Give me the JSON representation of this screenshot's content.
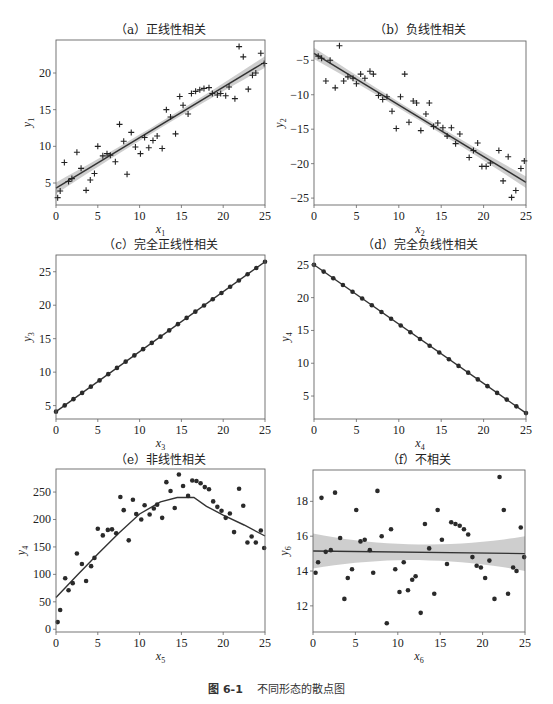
{
  "figure": {
    "caption_number": "图 6-1",
    "caption_text": "不同形态的散点图"
  },
  "chart_data": [
    {
      "id": "a",
      "type": "scatter",
      "title": "（a）正线性相关",
      "xlabel": "x",
      "xlabel_sub": "1",
      "ylabel": "y",
      "ylabel_sub": "1",
      "xlim": [
        0,
        25
      ],
      "ylim": [
        2,
        24.5
      ],
      "xticks": [
        0,
        5,
        10,
        15,
        20,
        25
      ],
      "yticks": [
        5,
        10,
        15,
        20
      ],
      "grid": false,
      "marker": "plus",
      "fit": {
        "type": "linear",
        "x": [
          0,
          25
        ],
        "y": [
          4.3,
          21.5
        ],
        "ci": true
      },
      "points": [
        [
          0.2,
          3.0
        ],
        [
          0.5,
          3.9
        ],
        [
          1.0,
          7.8
        ],
        [
          1.5,
          5.2
        ],
        [
          1.9,
          5.6
        ],
        [
          2.5,
          9.2
        ],
        [
          3.0,
          7.0
        ],
        [
          3.6,
          4.0
        ],
        [
          4.1,
          5.4
        ],
        [
          4.6,
          6.3
        ],
        [
          5.0,
          10.0
        ],
        [
          5.6,
          8.7
        ],
        [
          6.1,
          9.0
        ],
        [
          6.5,
          8.8
        ],
        [
          7.1,
          7.9
        ],
        [
          7.6,
          13.0
        ],
        [
          8.1,
          10.7
        ],
        [
          8.5,
          6.2
        ],
        [
          9.0,
          11.9
        ],
        [
          9.5,
          9.9
        ],
        [
          10.1,
          9.0
        ],
        [
          10.6,
          11.2
        ],
        [
          11.1,
          9.8
        ],
        [
          11.6,
          10.8
        ],
        [
          12.1,
          11.4
        ],
        [
          12.7,
          9.7
        ],
        [
          13.2,
          15.0
        ],
        [
          13.7,
          14.0
        ],
        [
          14.3,
          11.7
        ],
        [
          14.8,
          16.8
        ],
        [
          15.2,
          15.6
        ],
        [
          15.8,
          14.4
        ],
        [
          16.2,
          17.2
        ],
        [
          16.7,
          17.5
        ],
        [
          17.2,
          17.7
        ],
        [
          17.7,
          17.9
        ],
        [
          18.3,
          18.0
        ],
        [
          18.7,
          17.2
        ],
        [
          19.3,
          17.0
        ],
        [
          19.7,
          17.2
        ],
        [
          20.3,
          16.9
        ],
        [
          20.7,
          18.1
        ],
        [
          21.4,
          16.5
        ],
        [
          21.9,
          23.6
        ],
        [
          22.4,
          22.2
        ],
        [
          23.0,
          17.8
        ],
        [
          23.5,
          19.7
        ],
        [
          23.9,
          20.0
        ],
        [
          24.5,
          22.7
        ],
        [
          24.9,
          21.3
        ]
      ]
    },
    {
      "id": "b",
      "type": "scatter",
      "title": "（b）负线性相关",
      "xlabel": "x",
      "xlabel_sub": "2",
      "ylabel": "y",
      "ylabel_sub": "2",
      "xlim": [
        0,
        25
      ],
      "ylim": [
        -26,
        -2.2
      ],
      "xticks": [
        0,
        5,
        10,
        15,
        20,
        25
      ],
      "yticks": [
        -5,
        -10,
        -15,
        -20,
        -25
      ],
      "grid": false,
      "marker": "plus",
      "fit": {
        "type": "linear",
        "x": [
          0,
          25
        ],
        "y": [
          -4.0,
          -22.7
        ],
        "ci": true
      },
      "points": [
        [
          0.5,
          -4.4
        ],
        [
          0.9,
          -4.7
        ],
        [
          1.4,
          -8.0
        ],
        [
          1.9,
          -5.0
        ],
        [
          2.5,
          -9.0
        ],
        [
          3.0,
          -2.9
        ],
        [
          3.5,
          -8.0
        ],
        [
          4.0,
          -7.4
        ],
        [
          4.6,
          -7.6
        ],
        [
          5.0,
          -8.4
        ],
        [
          5.5,
          -7.0
        ],
        [
          6.0,
          -7.6
        ],
        [
          6.6,
          -6.6
        ],
        [
          7.0,
          -7.0
        ],
        [
          7.6,
          -10.1
        ],
        [
          8.1,
          -10.7
        ],
        [
          8.6,
          -10.3
        ],
        [
          9.2,
          -12.4
        ],
        [
          9.7,
          -14.9
        ],
        [
          10.2,
          -10.3
        ],
        [
          10.7,
          -7.0
        ],
        [
          11.2,
          -14.0
        ],
        [
          11.7,
          -10.9
        ],
        [
          12.1,
          -11.2
        ],
        [
          12.6,
          -15.2
        ],
        [
          13.2,
          -12.8
        ],
        [
          13.6,
          -11.2
        ],
        [
          14.1,
          -14.6
        ],
        [
          14.6,
          -14.1
        ],
        [
          15.2,
          -14.8
        ],
        [
          15.7,
          -16.0
        ],
        [
          16.2,
          -14.8
        ],
        [
          16.7,
          -17.1
        ],
        [
          17.2,
          -15.7
        ],
        [
          18.3,
          -19.1
        ],
        [
          18.8,
          -18.1
        ],
        [
          19.3,
          -17.0
        ],
        [
          19.8,
          -20.4
        ],
        [
          20.3,
          -20.4
        ],
        [
          20.8,
          -19.9
        ],
        [
          21.8,
          -18.1
        ],
        [
          22.3,
          -22.5
        ],
        [
          22.9,
          -19.0
        ],
        [
          23.3,
          -24.9
        ],
        [
          23.8,
          -23.9
        ],
        [
          24.4,
          -20.7
        ],
        [
          24.8,
          -19.6
        ]
      ]
    },
    {
      "id": "c",
      "type": "line",
      "title": "（c）完全正线性相关",
      "xlabel": "x",
      "xlabel_sub": "3",
      "ylabel": "y",
      "ylabel_sub": "3",
      "xlim": [
        0,
        25
      ],
      "ylim": [
        3,
        27.5
      ],
      "xticks": [
        0,
        5,
        10,
        15,
        20,
        25
      ],
      "yticks": [
        5,
        10,
        15,
        20,
        25
      ],
      "grid": false,
      "marker": "dot",
      "fit": {
        "type": "linear",
        "x": [
          0,
          25
        ],
        "y": [
          4.1,
          26.5
        ],
        "ci": false
      },
      "line": {
        "x0": 0,
        "y0": 4.1,
        "x1": 25,
        "y1": 26.5,
        "n": 25
      }
    },
    {
      "id": "d",
      "type": "line",
      "title": "（d）完全负线性相关",
      "xlabel": "x",
      "xlabel_sub": "4",
      "ylabel": "y",
      "ylabel_sub": "4",
      "xlim": [
        0,
        25
      ],
      "ylim": [
        1.5,
        26.5
      ],
      "xticks": [
        0,
        5,
        10,
        15,
        20,
        25
      ],
      "yticks": [
        5,
        10,
        15,
        20,
        25
      ],
      "grid": false,
      "marker": "dot",
      "fit": {
        "type": "linear",
        "x": [
          0,
          25
        ],
        "y": [
          25.0,
          2.4
        ],
        "ci": false
      },
      "line": {
        "x0": 0,
        "y0": 25.0,
        "x1": 25,
        "y1": 2.4,
        "n": 23
      }
    },
    {
      "id": "e",
      "type": "scatter",
      "title": "（e）非线性相关",
      "xlabel": "x",
      "xlabel_sub": "5",
      "ylabel": "y",
      "ylabel_sub": "4",
      "xlim": [
        0,
        25
      ],
      "ylim": [
        -5,
        292
      ],
      "xticks": [
        0,
        5,
        10,
        15,
        20,
        25
      ],
      "yticks": [
        0,
        50,
        100,
        150,
        200,
        250
      ],
      "grid": false,
      "marker": "dot",
      "fit": {
        "type": "lowess",
        "x": [
          0,
          2.5,
          5,
          7.5,
          10,
          12.5,
          14.5,
          16.5,
          18,
          20,
          22.5,
          25
        ],
        "y": [
          58,
          98,
          137,
          175,
          210,
          232,
          240,
          240,
          224,
          208,
          190,
          170
        ],
        "ci": false
      },
      "points": [
        [
          0.2,
          13
        ],
        [
          0.5,
          35
        ],
        [
          1.1,
          93
        ],
        [
          1.5,
          71
        ],
        [
          2.0,
          84
        ],
        [
          2.5,
          138
        ],
        [
          3.1,
          119
        ],
        [
          3.6,
          88
        ],
        [
          4.2,
          115
        ],
        [
          4.6,
          130
        ],
        [
          5.0,
          183
        ],
        [
          5.6,
          171
        ],
        [
          6.2,
          181
        ],
        [
          6.7,
          182
        ],
        [
          7.2,
          175
        ],
        [
          7.7,
          241
        ],
        [
          8.1,
          217
        ],
        [
          8.7,
          162
        ],
        [
          9.2,
          236
        ],
        [
          9.6,
          210
        ],
        [
          10.2,
          200
        ],
        [
          10.6,
          226
        ],
        [
          11.2,
          209
        ],
        [
          11.7,
          220
        ],
        [
          12.1,
          227
        ],
        [
          12.7,
          203
        ],
        [
          13.2,
          268
        ],
        [
          13.7,
          252
        ],
        [
          14.2,
          221
        ],
        [
          14.7,
          282
        ],
        [
          15.2,
          261
        ],
        [
          15.8,
          243
        ],
        [
          16.3,
          271
        ],
        [
          16.8,
          270
        ],
        [
          17.3,
          266
        ],
        [
          17.8,
          259
        ],
        [
          18.3,
          255
        ],
        [
          18.8,
          233
        ],
        [
          19.3,
          223
        ],
        [
          19.8,
          216
        ],
        [
          20.3,
          203
        ],
        [
          20.8,
          211
        ],
        [
          21.3,
          177
        ],
        [
          21.9,
          256
        ],
        [
          22.4,
          225
        ],
        [
          22.9,
          158
        ],
        [
          23.4,
          169
        ],
        [
          23.9,
          158
        ],
        [
          24.5,
          180
        ],
        [
          24.9,
          148
        ]
      ]
    },
    {
      "id": "f",
      "type": "scatter",
      "title": "（f）不相关",
      "xlabel": "x",
      "xlabel_sub": "6",
      "ylabel": "y",
      "ylabel_sub": "6",
      "xlim": [
        0,
        25
      ],
      "ylim": [
        10.5,
        19.8
      ],
      "xticks": [
        0,
        5,
        10,
        15,
        20,
        25
      ],
      "yticks": [
        12,
        14,
        16,
        18
      ],
      "grid": false,
      "marker": "dot",
      "fit": {
        "type": "linear",
        "x": [
          0,
          25
        ],
        "y": [
          15.15,
          15.0
        ],
        "ci": true,
        "ci_width_ends": 1.0,
        "ci_width_mid": 0.45
      },
      "points": [
        [
          0.3,
          13.9
        ],
        [
          0.6,
          14.5
        ],
        [
          1.0,
          18.2
        ],
        [
          1.5,
          15.1
        ],
        [
          2.1,
          15.2
        ],
        [
          2.6,
          18.5
        ],
        [
          3.2,
          15.9
        ],
        [
          3.7,
          12.4
        ],
        [
          4.1,
          13.6
        ],
        [
          4.6,
          14.1
        ],
        [
          5.1,
          17.5
        ],
        [
          5.6,
          15.7
        ],
        [
          6.1,
          15.8
        ],
        [
          6.7,
          15.2
        ],
        [
          7.1,
          13.9
        ],
        [
          7.6,
          18.6
        ],
        [
          8.1,
          16.0
        ],
        [
          8.7,
          11.0
        ],
        [
          9.2,
          16.4
        ],
        [
          9.7,
          14.1
        ],
        [
          10.2,
          12.8
        ],
        [
          10.7,
          14.5
        ],
        [
          11.2,
          12.9
        ],
        [
          11.7,
          13.5
        ],
        [
          12.1,
          13.7
        ],
        [
          12.7,
          11.6
        ],
        [
          13.2,
          16.7
        ],
        [
          13.7,
          15.3
        ],
        [
          14.3,
          12.7
        ],
        [
          14.7,
          17.5
        ],
        [
          15.2,
          15.8
        ],
        [
          15.8,
          14.4
        ],
        [
          16.3,
          16.8
        ],
        [
          16.8,
          16.7
        ],
        [
          17.3,
          16.6
        ],
        [
          17.8,
          16.4
        ],
        [
          18.3,
          16.1
        ],
        [
          18.8,
          14.8
        ],
        [
          19.3,
          14.3
        ],
        [
          19.8,
          14.2
        ],
        [
          20.3,
          13.6
        ],
        [
          20.8,
          14.6
        ],
        [
          21.4,
          12.4
        ],
        [
          22.0,
          19.4
        ],
        [
          22.5,
          17.5
        ],
        [
          23.0,
          12.7
        ],
        [
          23.6,
          14.2
        ],
        [
          24.0,
          14.0
        ],
        [
          24.5,
          16.5
        ],
        [
          24.9,
          14.8
        ]
      ]
    }
  ]
}
